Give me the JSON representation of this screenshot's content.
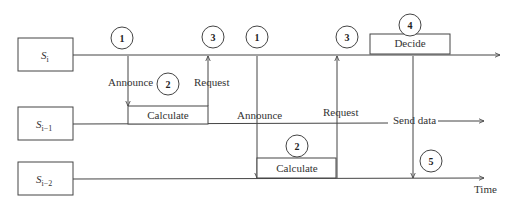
{
  "diagram": {
    "type": "sequence-timing-diagram",
    "colors": {
      "stroke": "#444444",
      "text": "#333333",
      "background": "#ffffff"
    },
    "nodes": [
      {
        "id": "si",
        "base": "S",
        "sub": "i"
      },
      {
        "id": "si1",
        "base": "S",
        "sub": "i−1"
      },
      {
        "id": "si2",
        "base": "S",
        "sub": "i−2"
      }
    ],
    "labels": {
      "announce_1": "Announce",
      "request_1": "Request",
      "calculate_1": "Calculate",
      "announce_2": "Announce",
      "request_2": "Request",
      "calculate_2": "Calculate",
      "decide": "Decide",
      "send_data": "Send data",
      "time_axis": "Time"
    },
    "steps": {
      "s1a": "1",
      "s2a": "2",
      "s3a": "3",
      "s1b": "1",
      "s2b": "2",
      "s3b": "3",
      "s4": "4",
      "s5": "5"
    }
  }
}
